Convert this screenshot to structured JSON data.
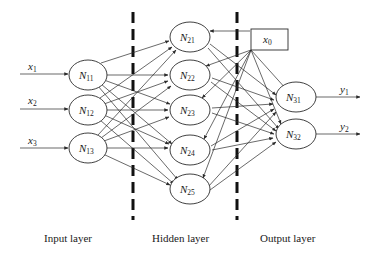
{
  "diagram": {
    "type": "neural-network",
    "inputs": [
      {
        "label": "x",
        "sub": "1"
      },
      {
        "label": "x",
        "sub": "2"
      },
      {
        "label": "x",
        "sub": "3"
      }
    ],
    "bias": {
      "label": "x",
      "sub": "0"
    },
    "layers": {
      "input": {
        "label": "Input layer",
        "nodes": [
          {
            "label": "N",
            "sub": "11"
          },
          {
            "label": "N",
            "sub": "12"
          },
          {
            "label": "N",
            "sub": "13"
          }
        ]
      },
      "hidden": {
        "label": "Hidden layer",
        "nodes": [
          {
            "label": "N",
            "sub": "21"
          },
          {
            "label": "N",
            "sub": "22"
          },
          {
            "label": "N",
            "sub": "23"
          },
          {
            "label": "N",
            "sub": "24"
          },
          {
            "label": "N",
            "sub": "25"
          }
        ]
      },
      "output": {
        "label": "Output layer",
        "nodes": [
          {
            "label": "N",
            "sub": "31"
          },
          {
            "label": "N",
            "sub": "32"
          }
        ]
      }
    },
    "outputs": [
      {
        "label": "y",
        "sub": "1"
      },
      {
        "label": "y",
        "sub": "2"
      }
    ],
    "colors": {
      "stroke": "#2a2a2a",
      "divider": "#111111",
      "background": "#ffffff"
    }
  }
}
